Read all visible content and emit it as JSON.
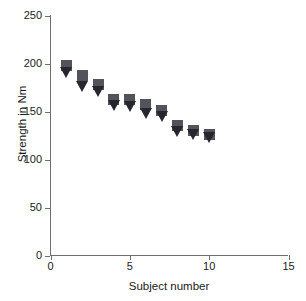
{
  "chart_data": {
    "type": "scatter",
    "title": "",
    "xlabel": "Subject number",
    "ylabel": "Strength in Nm",
    "xlim": [
      0,
      15
    ],
    "ylim": [
      0,
      250
    ],
    "xticks": [
      "0",
      "5",
      "10",
      "15"
    ],
    "xtick_values": [
      0,
      5,
      10,
      15
    ],
    "yticks": [
      "0",
      "50",
      "100",
      "150",
      "200",
      "250"
    ],
    "ytick_values": [
      0,
      50,
      100,
      150,
      200,
      250
    ],
    "grid": false,
    "legend": "none",
    "x": [
      1,
      2,
      3,
      4,
      5,
      6,
      7,
      8,
      9,
      10
    ],
    "series": [
      {
        "name": "square-marker",
        "marker": "square",
        "color": "#53535b",
        "values": [
          198,
          188,
          178,
          162,
          163,
          157,
          151,
          135,
          130,
          126
        ]
      },
      {
        "name": "triangle-marker",
        "marker": "triangle-down",
        "color": "#26262e",
        "values": [
          191,
          177,
          171,
          157,
          156,
          148,
          145,
          130,
          127,
          123
        ]
      }
    ]
  },
  "axis_color": "#6f6f6f",
  "text_color": "#1a1a1a"
}
